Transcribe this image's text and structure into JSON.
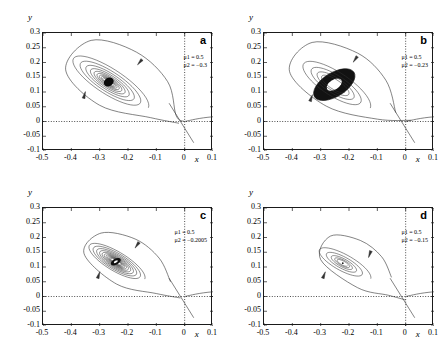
{
  "figure": {
    "axis_labels": {
      "x": "x",
      "y": "y"
    },
    "xticks": [
      "-0.5",
      "-0.4",
      "-0.3",
      "-0.2",
      "-0.1",
      "0",
      "0.1"
    ],
    "xtick_values": [
      -0.5,
      -0.4,
      -0.3,
      -0.2,
      -0.1,
      0,
      0.1
    ],
    "yticks": [
      "0.3",
      "0.25",
      "0.2",
      "0.15",
      "0.1",
      "0.05",
      "0",
      "-0.05",
      "-0.1"
    ],
    "ytick_values": [
      0.3,
      0.25,
      0.2,
      0.15,
      0.1,
      0.05,
      0,
      -0.05,
      -0.1
    ],
    "xlim": [
      -0.5,
      0.1
    ],
    "ylim": [
      -0.1,
      0.3
    ],
    "curve_color": "#303030",
    "axis_color": "#1a1a1a"
  },
  "panels": [
    {
      "letter": "a",
      "mu1": "μ1 = 0.5",
      "mu2": "μ2 = −0.3",
      "focus": {
        "x": -0.268,
        "y": 0.134
      },
      "core": "filled-blob"
    },
    {
      "letter": "b",
      "mu1": "μ1 = 0.5",
      "mu2": "μ2 = −0.23",
      "focus": {
        "x": -0.252,
        "y": 0.125
      },
      "core": "thick-annulus"
    },
    {
      "letter": "c",
      "mu1": "μ1 = 0.5",
      "mu2": "μ2 = −0.2005",
      "focus": {
        "x": -0.243,
        "y": 0.118
      },
      "core": "small-hole"
    },
    {
      "letter": "d",
      "mu1": "μ1 = 0.5",
      "mu2": "μ2 = −0.15",
      "focus": {
        "x": -0.222,
        "y": 0.113
      },
      "core": "point"
    }
  ],
  "chart_data": {
    "type": "line",
    "title": "",
    "xlabel": "x",
    "ylabel": "y",
    "xlim": [
      -0.5,
      0.1
    ],
    "ylim": [
      -0.1,
      0.3
    ],
    "grid": false,
    "legend": "none",
    "panels": [
      {
        "name": "a",
        "annotations": [
          "μ1 = 0.5",
          "μ2 = −0.3"
        ],
        "focus": [
          -0.268,
          0.134
        ],
        "spiral": {
          "turns": 9.5,
          "r0_x": 0.165,
          "r0_y": 0.105,
          "decay": 0.8,
          "tilt_deg": -32,
          "ellipse_ratio": 0.47
        },
        "homoclinic_loop": {
          "start": [
            0.012,
            -0.075
          ],
          "via": [
            [
              -0.02,
              -0.006
            ],
            [
              -0.12,
              0.013
            ],
            [
              -0.3,
              0.055
            ],
            [
              -0.42,
              0.175
            ],
            [
              -0.33,
              0.275
            ],
            [
              -0.17,
              0.235
            ],
            [
              -0.06,
              0.135
            ],
            [
              -0.03,
              0.02
            ],
            [
              0.0,
              0.0
            ]
          ]
        },
        "saddle": [
          0.0,
          0.0
        ],
        "arrows": [
          {
            "at": [
              -0.155,
              0.205
            ],
            "dir_deg": 230
          },
          {
            "at": [
              -0.355,
              0.085
            ],
            "dir_deg": 75
          }
        ]
      },
      {
        "name": "b",
        "annotations": [
          "μ1 = 0.5",
          "μ2 = −0.23"
        ],
        "focus": [
          -0.252,
          0.125
        ],
        "spiral": {
          "turns": 4.0,
          "r0_x": 0.15,
          "r0_y": 0.098,
          "decay": 0.74,
          "tilt_deg": -32,
          "ellipse_ratio": 0.5
        },
        "invariant_curve": {
          "outer_rx": 0.082,
          "outer_ry": 0.04,
          "inner_rx": 0.03,
          "inner_ry": 0.016,
          "tilt_deg": -32
        },
        "homoclinic_loop": {
          "start": [
            0.1,
            0.022
          ],
          "via": [
            [
              0.02,
              0.004
            ],
            [
              -0.1,
              0.008
            ],
            [
              -0.28,
              0.052
            ],
            [
              -0.41,
              0.17
            ],
            [
              -0.33,
              0.268
            ],
            [
              -0.17,
              0.232
            ],
            [
              -0.07,
              0.14
            ],
            [
              -0.035,
              0.03
            ]
          ]
        },
        "saddle": [
          0.0,
          0.0
        ],
        "arrows": [
          {
            "at": [
              -0.175,
              0.215
            ],
            "dir_deg": 235
          },
          {
            "at": [
              -0.335,
              0.075
            ],
            "dir_deg": 70
          }
        ]
      },
      {
        "name": "c",
        "annotations": [
          "μ1 = 0.5",
          "μ2 = −0.2005"
        ],
        "focus": [
          -0.243,
          0.118
        ],
        "spiral": {
          "turns": 11.0,
          "r0_x": 0.118,
          "r0_y": 0.072,
          "decay": 0.845,
          "tilt_deg": -30,
          "ellipse_ratio": 0.5
        },
        "homoclinic_loop": {
          "start": [
            0.012,
            -0.072
          ],
          "via": [
            [
              -0.015,
              -0.005
            ],
            [
              -0.1,
              0.01
            ],
            [
              -0.24,
              0.042
            ],
            [
              -0.355,
              0.145
            ],
            [
              -0.295,
              0.215
            ],
            [
              -0.175,
              0.195
            ],
            [
              -0.09,
              0.13
            ],
            [
              -0.05,
              0.05
            ]
          ]
        },
        "saddle": [
          0.0,
          0.0
        ],
        "arrows": [
          {
            "at": [
              -0.165,
              0.178
            ],
            "dir_deg": 235
          },
          {
            "at": [
              -0.305,
              0.068
            ],
            "dir_deg": 72
          }
        ]
      },
      {
        "name": "d",
        "annotations": [
          "μ1 = 0.5",
          "μ2 = −0.15"
        ],
        "focus": [
          -0.222,
          0.113
        ],
        "spiral": {
          "turns": 5.0,
          "r0_x": 0.112,
          "r0_y": 0.066,
          "decay": 0.7,
          "tilt_deg": -28,
          "ellipse_ratio": 0.52
        },
        "homoclinic_loop": {
          "start": [
            0.035,
            -0.055
          ],
          "via": [
            [
              0.0,
              -0.012
            ],
            [
              -0.06,
              0.004
            ],
            [
              -0.17,
              0.03
            ],
            [
              -0.3,
              0.125
            ],
            [
              -0.265,
              0.205
            ],
            [
              -0.16,
              0.19
            ],
            [
              -0.085,
              0.135
            ],
            [
              -0.05,
              0.065
            ]
          ]
        },
        "saddle": [
          0.0,
          0.0
        ],
        "arrows": [
          {
            "at": [
              -0.125,
              0.148
            ],
            "dir_deg": 250
          },
          {
            "at": [
              -0.29,
              0.068
            ],
            "dir_deg": 68
          }
        ]
      }
    ]
  }
}
